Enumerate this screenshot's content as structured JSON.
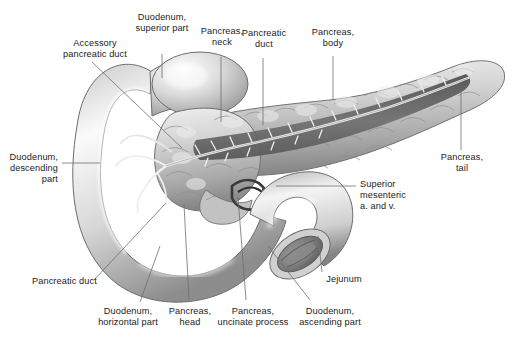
{
  "figure": {
    "background_color": "#ffffff",
    "label_color": "#1b1b1b",
    "leader_color": "#6f6f6f",
    "style": "grayscale anatomical illustration"
  },
  "labels": [
    {
      "id": "duodenum-superior-part",
      "text": "Duodenum,\nsuperior part",
      "align": "center"
    },
    {
      "id": "accessory-pancreatic-duct",
      "text": "Accessory\npancreatic duct",
      "align": "center"
    },
    {
      "id": "pancreas-neck",
      "text": "Pancreas,\nneck",
      "align": "center"
    },
    {
      "id": "pancreatic-duct-top",
      "text": "Pancreatic\nduct",
      "align": "center"
    },
    {
      "id": "pancreas-body",
      "text": "Pancreas,\nbody",
      "align": "center"
    },
    {
      "id": "pancreas-tail",
      "text": "Pancreas,\ntail",
      "align": "center"
    },
    {
      "id": "duodenum-descending-part",
      "text": "Duodenum,\ndescending\npart",
      "align": "right"
    },
    {
      "id": "superior-mesenteric",
      "text": "Superior\nmesenteric\na. and v.",
      "align": "left"
    },
    {
      "id": "jejunum",
      "text": "Jejunum",
      "align": "center"
    },
    {
      "id": "pancreatic-duct-left",
      "text": "Pancreatic duct",
      "align": "left"
    },
    {
      "id": "duodenum-horizontal-part",
      "text": "Duodenum,\nhorizontal part",
      "align": "center"
    },
    {
      "id": "pancreas-head",
      "text": "Pancreas,\nhead",
      "align": "center"
    },
    {
      "id": "pancreas-uncinate-process",
      "text": "Pancreas,\nuncinate process",
      "align": "center"
    },
    {
      "id": "duodenum-ascending-part",
      "text": "Duodenum,\nascending part",
      "align": "center"
    }
  ]
}
